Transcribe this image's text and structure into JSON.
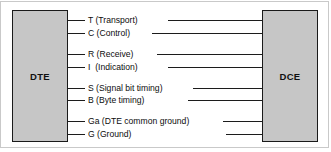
{
  "diagram": {
    "left_node": {
      "label": "DTE"
    },
    "right_node": {
      "label": "DCE"
    },
    "colors": {
      "node_fill": "#c6c6c6",
      "node_border": "#1a1a1a",
      "line": "#1c1c1c",
      "text": "#0d0d0d",
      "background": "#ffffff",
      "frame": "#c9c9c9"
    },
    "signals": [
      {
        "code": "T",
        "name": "Transport",
        "label": "T (Transport)",
        "y": 20,
        "text_x": 88,
        "right_start": 168
      },
      {
        "code": "C",
        "name": "Control",
        "label": "C (Control)",
        "y": 33,
        "text_x": 88,
        "right_start": 152
      },
      {
        "code": "R",
        "name": "Receive",
        "label": "R (Receive)",
        "y": 54,
        "text_x": 88,
        "right_start": 157
      },
      {
        "code": "I",
        "name": "Indication",
        "label": "I  (Indication)",
        "y": 67,
        "text_x": 88,
        "right_start": 168
      },
      {
        "code": "S",
        "name": "Signal bit timing",
        "label": "S (Signal bit timing)",
        "y": 88,
        "text_x": 88,
        "right_start": 193
      },
      {
        "code": "B",
        "name": "Byte timing",
        "label": "B (Byte timing)",
        "y": 100,
        "text_x": 88,
        "right_start": 188
      },
      {
        "code": "Ga",
        "name": "DTE common ground",
        "label": "Ga (DTE common ground)",
        "y": 121,
        "text_x": 88,
        "right_start": 223
      },
      {
        "code": "G",
        "name": "Ground",
        "label": "G (Ground)",
        "y": 134,
        "text_x": 88,
        "right_start": 226
      }
    ],
    "geometry": {
      "left_box": {
        "x": 12,
        "y": 10,
        "w": 56,
        "h": 132
      },
      "right_box": {
        "x": 262,
        "y": 10,
        "w": 56,
        "h": 132
      },
      "left_stub_start": 68,
      "right_stub_end": 262
    }
  }
}
